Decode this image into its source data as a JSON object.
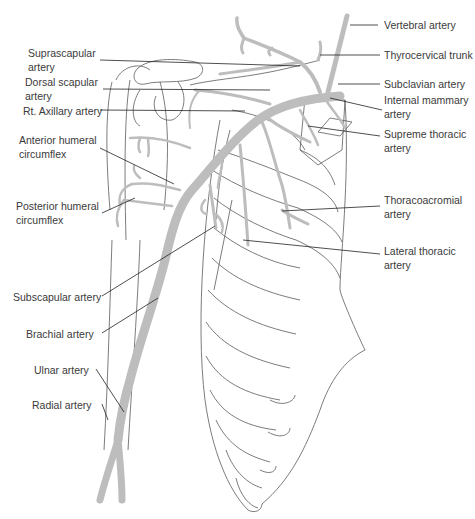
{
  "figure": {
    "colors": {
      "artery_fill": "#bdbdbd",
      "outline": "#5a5a5a",
      "leader_line": "#222222",
      "label_text": "#3a3a3a",
      "background": "#ffffff"
    }
  },
  "labels": {
    "left": [
      {
        "id": "suprascapular",
        "text": "Suprascapular\nartery"
      },
      {
        "id": "dorsal_scapular",
        "text": "Dorsal scapular\nartery"
      },
      {
        "id": "rt_axillary",
        "text": "Rt. Axillary artery"
      },
      {
        "id": "anterior_humeral",
        "text": "Anterior humeral\ncircumflex"
      },
      {
        "id": "posterior_humeral",
        "text": "Posterior humeral\ncircumflex"
      },
      {
        "id": "subscapular",
        "text": "Subscapular artery"
      },
      {
        "id": "brachial",
        "text": "Brachial artery"
      },
      {
        "id": "ulnar",
        "text": "Ulnar artery"
      },
      {
        "id": "radial",
        "text": "Radial artery"
      }
    ],
    "right": [
      {
        "id": "vertebral",
        "text": "Vertebral artery"
      },
      {
        "id": "thyrocervical",
        "text": "Thyrocervical trunk"
      },
      {
        "id": "subclavian",
        "text": "Subclavian artery"
      },
      {
        "id": "internal_mammary",
        "text": "Internal mammary\nartery"
      },
      {
        "id": "supreme_thoracic",
        "text": "Supreme thoracic\nartery"
      },
      {
        "id": "thoracoacromial",
        "text": "Thoracoacromial\nartery"
      },
      {
        "id": "lateral_thoracic",
        "text": "Lateral thoracic\nartery"
      }
    ]
  }
}
